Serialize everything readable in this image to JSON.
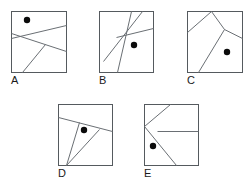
{
  "figure": {
    "title": "",
    "background_color": "#ffffff",
    "box_stroke_color": "#555a5e",
    "line_stroke_color": "#6a6f74",
    "dot_color": "#0b0b0b",
    "label_color": "#1a1a1a",
    "panel_count": 5
  },
  "panels": [
    {
      "label": "A",
      "label_x": 11,
      "label_y": 84,
      "box": {
        "x": 11,
        "y": 11,
        "w": 55,
        "h": 61
      },
      "dot": {
        "cx": 27,
        "cy": 20,
        "r": 3.2
      },
      "segments": [
        {
          "name": "segment-a-1",
          "x1": 66,
          "y1": 25,
          "x2": 11,
          "y2": 38
        },
        {
          "name": "segment-a-2",
          "x1": 11,
          "y1": 33,
          "x2": 66,
          "y2": 51
        },
        {
          "name": "segment-a-3",
          "x1": 22,
          "y1": 72,
          "x2": 45,
          "y2": 44
        }
      ]
    },
    {
      "label": "B",
      "label_x": 99,
      "label_y": 84,
      "box": {
        "x": 99,
        "y": 11,
        "w": 54,
        "h": 61
      },
      "dot": {
        "cx": 134,
        "cy": 45,
        "r": 3.2
      },
      "segments": [
        {
          "name": "segment-b-1",
          "x1": 103,
          "y1": 61,
          "x2": 142,
          "y2": 11
        },
        {
          "name": "segment-b-2",
          "x1": 117,
          "y1": 72,
          "x2": 131,
          "y2": 11
        },
        {
          "name": "segment-b-3",
          "x1": 116,
          "y1": 37,
          "x2": 153,
          "y2": 28
        }
      ]
    },
    {
      "label": "C",
      "label_x": 187,
      "label_y": 84,
      "box": {
        "x": 187,
        "y": 11,
        "w": 55,
        "h": 61
      },
      "dot": {
        "cx": 227,
        "cy": 52,
        "r": 3.2
      },
      "segments": [
        {
          "name": "segment-c-1",
          "x1": 187,
          "y1": 32,
          "x2": 211,
          "y2": 11
        },
        {
          "name": "segment-c-2",
          "x1": 211,
          "y1": 11,
          "x2": 224,
          "y2": 29
        },
        {
          "name": "segment-c-3",
          "x1": 224,
          "y1": 29,
          "x2": 242,
          "y2": 38
        },
        {
          "name": "segment-c-4",
          "x1": 224,
          "y1": 29,
          "x2": 198,
          "y2": 72
        }
      ]
    },
    {
      "label": "D",
      "label_x": 58,
      "label_y": 177,
      "box": {
        "x": 58,
        "y": 104,
        "w": 54,
        "h": 61
      },
      "dot": {
        "cx": 84,
        "cy": 130,
        "r": 3.2
      },
      "segments": [
        {
          "name": "segment-d-1",
          "x1": 58,
          "y1": 117,
          "x2": 112,
          "y2": 131
        },
        {
          "name": "segment-d-2",
          "x1": 66,
          "y1": 165,
          "x2": 79,
          "y2": 122
        },
        {
          "name": "segment-d-3",
          "x1": 66,
          "y1": 165,
          "x2": 99,
          "y2": 129
        }
      ]
    },
    {
      "label": "E",
      "label_x": 144,
      "label_y": 177,
      "box": {
        "x": 144,
        "y": 104,
        "w": 54,
        "h": 61
      },
      "dot": {
        "cx": 153,
        "cy": 146,
        "r": 3.2
      },
      "segments": [
        {
          "name": "segment-e-1",
          "x1": 144,
          "y1": 126,
          "x2": 170,
          "y2": 104
        },
        {
          "name": "segment-e-2",
          "x1": 144,
          "y1": 126,
          "x2": 176,
          "y2": 165
        },
        {
          "name": "segment-e-3",
          "x1": 157,
          "y1": 131,
          "x2": 198,
          "y2": 131
        }
      ]
    }
  ]
}
